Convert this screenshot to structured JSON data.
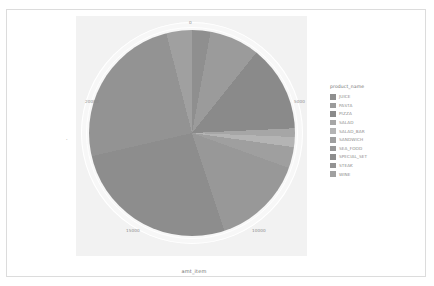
{
  "chart_data": {
    "type": "pie",
    "title": "",
    "xlabel": "amt_item",
    "ylabel": "",
    "legend_title": "product_name",
    "legend_position": "right",
    "grid": true,
    "axis_ticks": [
      "0",
      "5000",
      "10000",
      "15000",
      "20000"
    ],
    "axis_range": [
      0,
      22000
    ],
    "categories": [
      "JUICE",
      "PASTA",
      "PIZZA",
      "SALAD",
      "SALAD_BAR",
      "SANDWICH",
      "SEA_FOOD",
      "SPECIAL_SET",
      "STEAK",
      "WINE"
    ],
    "values": [
      640,
      1730,
      2990,
      300,
      350,
      730,
      3180,
      5850,
      5430,
      890
    ],
    "colors": [
      "#8f8f8f",
      "#9b9b9b",
      "#8a8a8a",
      "#a6a6a6",
      "#b4b4b4",
      "#9f9f9f",
      "#989898",
      "#8d8d8d",
      "#939393",
      "#a0a0a0"
    ]
  },
  "axes": {
    "x_title": "amt_item",
    "y_title": "·"
  },
  "legend": {
    "title": "product_name",
    "items": [
      {
        "label": "JUICE",
        "color": "#8f8f8f"
      },
      {
        "label": "PASTA",
        "color": "#9b9b9b"
      },
      {
        "label": "PIZZA",
        "color": "#8a8a8a"
      },
      {
        "label": "SALAD",
        "color": "#a6a6a6"
      },
      {
        "label": "SALAD_BAR",
        "color": "#b4b4b4"
      },
      {
        "label": "SANDWICH",
        "color": "#9f9f9f"
      },
      {
        "label": "SEA_FOOD",
        "color": "#989898"
      },
      {
        "label": "SPECIAL_SET",
        "color": "#8d8d8d"
      },
      {
        "label": "STEAK",
        "color": "#939393"
      },
      {
        "label": "WINE",
        "color": "#a0a0a0"
      }
    ]
  },
  "ticks": {
    "t0": "0",
    "t5000": "5000",
    "t10000": "10000",
    "t15000": "15000",
    "t20000": "20000"
  }
}
